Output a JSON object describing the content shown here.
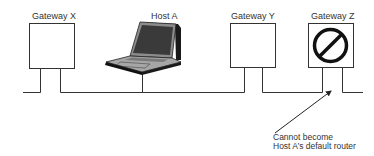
{
  "diagram": {
    "nodes": [
      {
        "id": "gateway-x",
        "label": "Gateway X",
        "type": "router"
      },
      {
        "id": "host-a",
        "label": "Host A",
        "type": "laptop"
      },
      {
        "id": "gateway-y",
        "label": "Gateway Y",
        "type": "router"
      },
      {
        "id": "gateway-z",
        "label": "Gateway Z",
        "type": "router",
        "status": "blocked",
        "icon": "prohibited-icon"
      }
    ],
    "annotation": {
      "target": "gateway-z",
      "line1": "Cannot become",
      "line2": "Host A’s default router"
    },
    "colors": {
      "line": "#333333",
      "box_border": "#333333",
      "laptop_body": "#9a9a9a",
      "laptop_dark": "#1a1a1a",
      "text": "#333333"
    }
  }
}
